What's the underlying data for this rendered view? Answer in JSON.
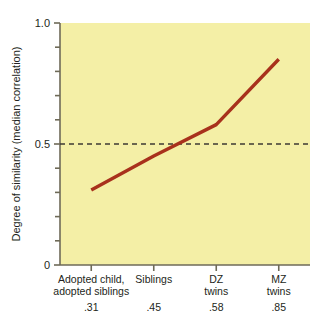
{
  "chart_data": {
    "type": "line",
    "title": "",
    "subtitle": "",
    "xlabel": "",
    "ylabel": "Degree of similarity (median correlation)",
    "categories": [
      "Adopted child, adopted siblings",
      "Siblings",
      "DZ twins",
      "MZ twins"
    ],
    "category_lines": [
      [
        "Adopted child,",
        "adopted siblings"
      ],
      [
        "Siblings"
      ],
      [
        "DZ",
        "twins"
      ],
      [
        "MZ",
        "twins"
      ]
    ],
    "values": [
      0.31,
      0.45,
      0.58,
      0.85
    ],
    "value_labels": [
      ".31",
      ".45",
      ".58",
      ".85"
    ],
    "ylim": [
      0,
      1.0
    ],
    "y_tick_labels": [
      "1.0",
      "0.5",
      "0"
    ],
    "y_major_ticks": [
      1.0,
      0.5,
      0
    ],
    "y_minor_ticks": [
      0.9,
      0.8,
      0.7,
      0.6,
      0.4,
      0.3,
      0.2,
      0.1
    ],
    "reference_line": {
      "value": 0.5,
      "style": "dashed"
    },
    "grid": false,
    "legend": null,
    "colors": {
      "plot_background": "#f4efa6",
      "line": "#a8311c",
      "axis": "#6e6a58",
      "reference_line": "#3c3a33",
      "text": "#231f20",
      "page_background": "#ffffff"
    }
  }
}
